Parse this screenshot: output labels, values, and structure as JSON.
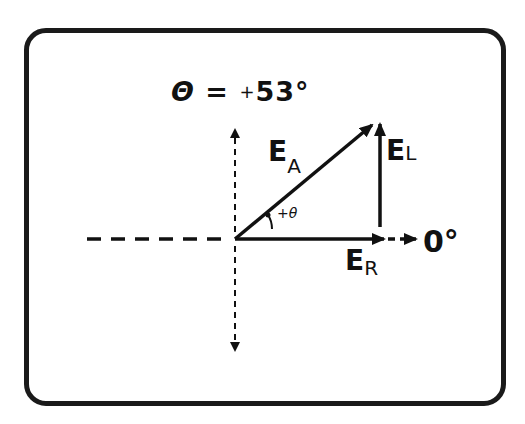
{
  "title": {
    "symbol": "Θ",
    "equals": "=",
    "sign": "+",
    "value": "53°"
  },
  "vectors": {
    "applied": {
      "main": "E",
      "sub": "A"
    },
    "inductive": {
      "main": "E",
      "sub": "L"
    },
    "resistive": {
      "main": "E",
      "sub": "R"
    }
  },
  "reference_label": "0°",
  "angle_label": "+θ",
  "colors": {
    "ink": "#111111",
    "background": "#ffffff"
  }
}
